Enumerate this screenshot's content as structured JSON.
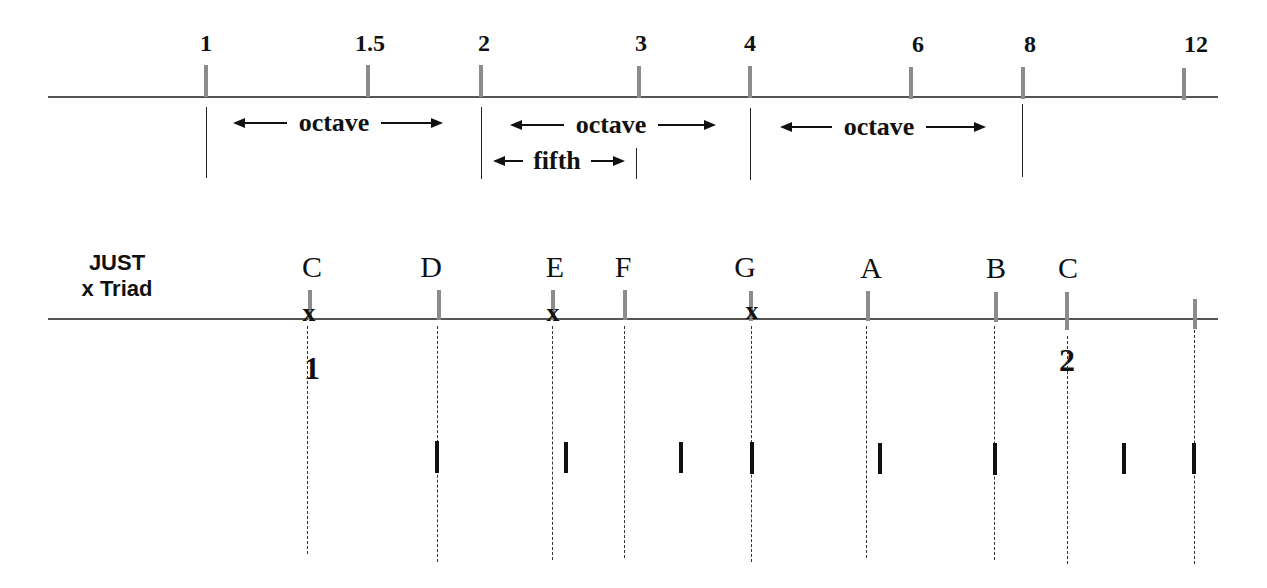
{
  "harmonic_scale": {
    "ticks": [
      {
        "label": "1",
        "x": 206,
        "lx": 206
      },
      {
        "label": "1.5",
        "x": 368,
        "lx": 370
      },
      {
        "label": "2",
        "x": 481,
        "lx": 484
      },
      {
        "label": "3",
        "x": 639,
        "lx": 641
      },
      {
        "label": "4",
        "x": 750,
        "lx": 750
      },
      {
        "label": "6",
        "x": 911,
        "lx": 918
      },
      {
        "label": "8",
        "x": 1023,
        "lx": 1030
      },
      {
        "label": "12",
        "x": 1184,
        "lx": 1196
      }
    ],
    "intervals": [
      {
        "label": "octave",
        "from": "1",
        "to": "2"
      },
      {
        "label": "octave",
        "from": "2",
        "to": "4"
      },
      {
        "label": "octave",
        "from": "4",
        "to": "8"
      },
      {
        "label": "fifth",
        "from": "2",
        "to": "3"
      }
    ]
  },
  "just_scale": {
    "title_line1": "JUST",
    "title_line2": "x Triad",
    "triad_marker": "x",
    "notes": [
      {
        "label": "C",
        "x": 310,
        "triad": true
      },
      {
        "label": "D",
        "x": 439,
        "triad": false
      },
      {
        "label": "E",
        "x": 553,
        "triad": true
      },
      {
        "label": "F",
        "x": 625,
        "triad": false
      },
      {
        "label": "G",
        "x": 751,
        "triad": true
      },
      {
        "label": "A",
        "x": 868,
        "triad": false
      },
      {
        "label": "B",
        "x": 996,
        "triad": false
      },
      {
        "label": "C",
        "x": 1066,
        "triad": false
      }
    ],
    "octave_numbers": [
      {
        "label": "1",
        "x": 312
      },
      {
        "label": "2",
        "x": 1067
      }
    ]
  },
  "comparison_marks_x": [
    437,
    566,
    681,
    752,
    880,
    995,
    1124,
    1194
  ]
}
